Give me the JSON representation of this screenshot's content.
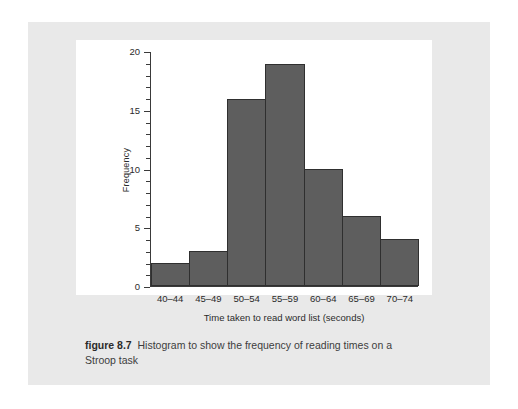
{
  "figure": {
    "label": "figure 8.7",
    "caption": "Histogram to show the frequency of reading times on a Stroop task"
  },
  "colors": {
    "bar_fill": "#5e5e5e",
    "bar_stroke": "#2f2f2f",
    "panel_bg": "#e9e9e9",
    "plot_bg": "#ffffff",
    "axis": "#3a3a3a",
    "text": "#2b2b2b"
  },
  "chart_data": {
    "type": "bar",
    "title": "",
    "subtitle": "",
    "categories": [
      "40–44",
      "45–49",
      "50–54",
      "55–59",
      "60–64",
      "65–69",
      "70–74"
    ],
    "values": [
      2,
      3,
      16,
      19,
      10,
      6,
      4
    ],
    "xlabel": "Time taken to read word list (seconds)",
    "ylabel": "Frequency",
    "ylim": [
      0,
      20
    ],
    "ytick_labels": [
      "0",
      "5",
      "10",
      "15",
      "20"
    ],
    "ytick_values": [
      0,
      5,
      10,
      15,
      20
    ],
    "yminor_step": 1,
    "grid": false,
    "legend": false
  }
}
